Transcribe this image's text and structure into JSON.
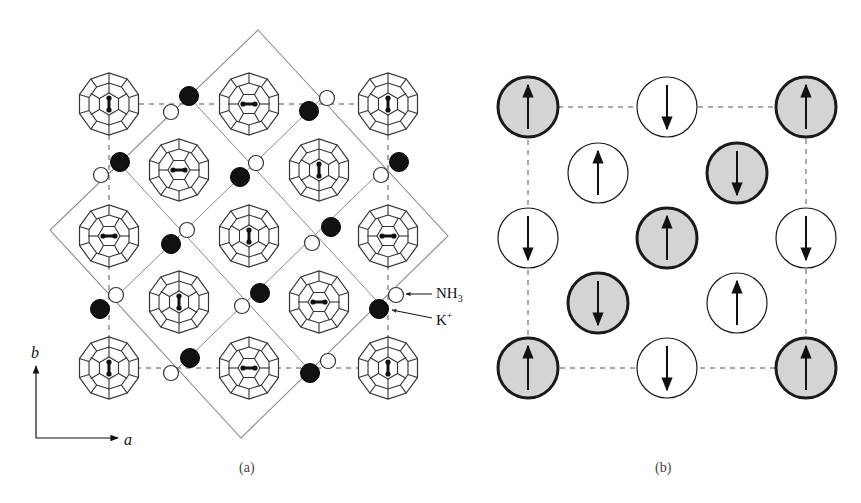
{
  "panel_a": {
    "caption": "(a)",
    "labels": {
      "nh3": "NH",
      "nh3_sub": "3",
      "k": "K",
      "k_sup": "+"
    },
    "axes": {
      "x": "a",
      "y": "b"
    },
    "fullerenes": [
      {
        "x": 109,
        "y": 104,
        "dimer": "v"
      },
      {
        "x": 249,
        "y": 104,
        "dimer": "h"
      },
      {
        "x": 388,
        "y": 104,
        "dimer": "v"
      },
      {
        "x": 179,
        "y": 170,
        "dimer": "h"
      },
      {
        "x": 319,
        "y": 170,
        "dimer": "v"
      },
      {
        "x": 109,
        "y": 236,
        "dimer": "h"
      },
      {
        "x": 249,
        "y": 236,
        "dimer": "v"
      },
      {
        "x": 388,
        "y": 236,
        "dimer": "h"
      },
      {
        "x": 179,
        "y": 302,
        "dimer": "v"
      },
      {
        "x": 319,
        "y": 302,
        "dimer": "h"
      },
      {
        "x": 109,
        "y": 368,
        "dimer": "v"
      },
      {
        "x": 249,
        "y": 368,
        "dimer": "h"
      },
      {
        "x": 388,
        "y": 368,
        "dimer": "v"
      }
    ],
    "k_ions": [
      {
        "x": 189,
        "y": 96
      },
      {
        "x": 309,
        "y": 111
      },
      {
        "x": 120,
        "y": 162
      },
      {
        "x": 240,
        "y": 177
      },
      {
        "x": 399,
        "y": 162
      },
      {
        "x": 171,
        "y": 244
      },
      {
        "x": 331,
        "y": 227
      },
      {
        "x": 100,
        "y": 309
      },
      {
        "x": 260,
        "y": 293
      },
      {
        "x": 379,
        "y": 309
      },
      {
        "x": 190,
        "y": 358
      },
      {
        "x": 310,
        "y": 373
      }
    ],
    "nh3": [
      {
        "x": 171,
        "y": 112
      },
      {
        "x": 327,
        "y": 98
      },
      {
        "x": 101,
        "y": 175
      },
      {
        "x": 256,
        "y": 163
      },
      {
        "x": 381,
        "y": 175
      },
      {
        "x": 187,
        "y": 230
      },
      {
        "x": 312,
        "y": 243
      },
      {
        "x": 116,
        "y": 295
      },
      {
        "x": 242,
        "y": 306
      },
      {
        "x": 396,
        "y": 295
      },
      {
        "x": 171,
        "y": 373
      },
      {
        "x": 328,
        "y": 361
      }
    ],
    "cell": {
      "top": [
        258,
        30
      ],
      "right": [
        448,
        236
      ],
      "bottom": [
        241,
        438
      ],
      "left": [
        50,
        230
      ]
    },
    "colors": {
      "line": "#333333",
      "cell": "#8a8a8a",
      "k_fill": "#111111"
    }
  },
  "panel_b": {
    "caption": "(b)",
    "spins": [
      {
        "x": 528,
        "y": 107,
        "spin": "up",
        "shaded": true
      },
      {
        "x": 667,
        "y": 107,
        "spin": "down",
        "shaded": false
      },
      {
        "x": 806,
        "y": 107,
        "spin": "up",
        "shaded": true
      },
      {
        "x": 598,
        "y": 173,
        "spin": "up",
        "shaded": false
      },
      {
        "x": 737,
        "y": 173,
        "spin": "down",
        "shaded": true
      },
      {
        "x": 528,
        "y": 238,
        "spin": "down",
        "shaded": false
      },
      {
        "x": 667,
        "y": 238,
        "spin": "up",
        "shaded": true
      },
      {
        "x": 806,
        "y": 238,
        "spin": "down",
        "shaded": false
      },
      {
        "x": 598,
        "y": 303,
        "spin": "down",
        "shaded": true
      },
      {
        "x": 737,
        "y": 303,
        "spin": "up",
        "shaded": false
      },
      {
        "x": 528,
        "y": 368,
        "spin": "up",
        "shaded": true
      },
      {
        "x": 667,
        "y": 368,
        "spin": "down",
        "shaded": false
      },
      {
        "x": 806,
        "y": 368,
        "spin": "up",
        "shaded": true
      }
    ],
    "colors": {
      "shade": "#d4d4d4",
      "stroke": "#1a1a1a"
    }
  }
}
